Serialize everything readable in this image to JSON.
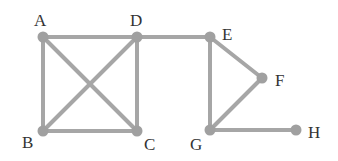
{
  "graph": {
    "nodes": [
      {
        "id": "A",
        "label": "A",
        "x": 43,
        "y": 37,
        "lx": 34,
        "ly": 26
      },
      {
        "id": "D",
        "label": "D",
        "x": 137,
        "y": 37,
        "lx": 130,
        "ly": 26
      },
      {
        "id": "B",
        "label": "B",
        "x": 43,
        "y": 131,
        "lx": 22,
        "ly": 148
      },
      {
        "id": "C",
        "label": "C",
        "x": 137,
        "y": 131,
        "lx": 144,
        "ly": 150
      },
      {
        "id": "E",
        "label": "E",
        "x": 210,
        "y": 37,
        "lx": 222,
        "ly": 40
      },
      {
        "id": "F",
        "label": "F",
        "x": 262,
        "y": 78,
        "lx": 275,
        "ly": 86
      },
      {
        "id": "G",
        "label": "G",
        "x": 210,
        "y": 130,
        "lx": 190,
        "ly": 150
      },
      {
        "id": "H",
        "label": "H",
        "x": 296,
        "y": 130,
        "lx": 308,
        "ly": 138
      }
    ],
    "edges": [
      [
        "A",
        "D"
      ],
      [
        "A",
        "B"
      ],
      [
        "A",
        "C"
      ],
      [
        "D",
        "B"
      ],
      [
        "D",
        "C"
      ],
      [
        "B",
        "C"
      ],
      [
        "D",
        "E"
      ],
      [
        "E",
        "F"
      ],
      [
        "E",
        "G"
      ],
      [
        "F",
        "G"
      ],
      [
        "G",
        "H"
      ]
    ]
  }
}
